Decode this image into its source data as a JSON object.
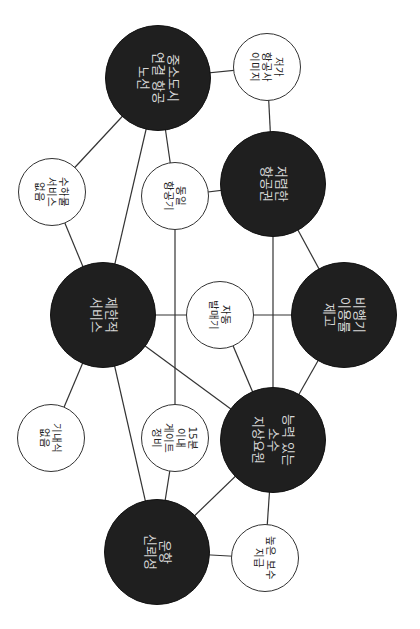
{
  "diagram": {
    "title": "",
    "orientation": "rotated-90-clockwise",
    "colors": {
      "dark_node": "#1f1f1f",
      "light_node": "#ffffff",
      "edge": "#333333",
      "dark_text": "#d8d8d8",
      "light_text": "#222222"
    },
    "nodes": [
      {
        "id": "n1",
        "type": "dark",
        "label": "중소도시\n연결 항공\n노선",
        "cx": 158,
        "cy": 78,
        "r": 53
      },
      {
        "id": "n2",
        "type": "light",
        "label": "저가\n항공사\n이미지",
        "cx": 267,
        "cy": 67,
        "r": 34
      },
      {
        "id": "n3",
        "type": "light",
        "label": "수하물\n서비스\n없음",
        "cx": 52,
        "cy": 192,
        "r": 34
      },
      {
        "id": "n4",
        "type": "light",
        "label": "동일\n항공기",
        "cx": 175,
        "cy": 196,
        "r": 34
      },
      {
        "id": "n5",
        "type": "dark",
        "label": "저렴한\n항공권",
        "cx": 273,
        "cy": 184,
        "r": 53
      },
      {
        "id": "n6",
        "type": "dark",
        "label": "제한적\n서비스",
        "cx": 103,
        "cy": 315,
        "r": 53
      },
      {
        "id": "n7",
        "type": "light",
        "label": "자동\n발매기",
        "cx": 220,
        "cy": 315,
        "r": 34
      },
      {
        "id": "n8",
        "type": "dark",
        "label": "비행기\n이용률\n제고",
        "cx": 344,
        "cy": 315,
        "r": 53
      },
      {
        "id": "n9",
        "type": "light",
        "label": "기내식\n없음",
        "cx": 51,
        "cy": 438,
        "r": 34
      },
      {
        "id": "n10",
        "type": "light",
        "label": "15분\n이내\n게이트\n정비",
        "cx": 175,
        "cy": 438,
        "r": 34
      },
      {
        "id": "n11",
        "type": "dark",
        "label": "능력 있는\n소수\n지상요원",
        "cx": 273,
        "cy": 440,
        "r": 53
      },
      {
        "id": "n12",
        "type": "dark",
        "label": "운항\n신뢰성",
        "cx": 157,
        "cy": 552,
        "r": 53
      },
      {
        "id": "n13",
        "type": "light",
        "label": "높은 보수\n지급",
        "cx": 265,
        "cy": 558,
        "r": 34
      }
    ],
    "edges": [
      [
        "n1",
        "n2"
      ],
      [
        "n2",
        "n5"
      ],
      [
        "n1",
        "n3"
      ],
      [
        "n1",
        "n6"
      ],
      [
        "n1",
        "n4"
      ],
      [
        "n4",
        "n5"
      ],
      [
        "n4",
        "n10"
      ],
      [
        "n3",
        "n6"
      ],
      [
        "n5",
        "n8"
      ],
      [
        "n5",
        "n11"
      ],
      [
        "n6",
        "n7"
      ],
      [
        "n7",
        "n8"
      ],
      [
        "n7",
        "n11"
      ],
      [
        "n6",
        "n11"
      ],
      [
        "n6",
        "n9"
      ],
      [
        "n6",
        "n12"
      ],
      [
        "n8",
        "n11"
      ],
      [
        "n10",
        "n12"
      ],
      [
        "n11",
        "n12"
      ],
      [
        "n11",
        "n13"
      ],
      [
        "n12",
        "n13"
      ]
    ]
  }
}
